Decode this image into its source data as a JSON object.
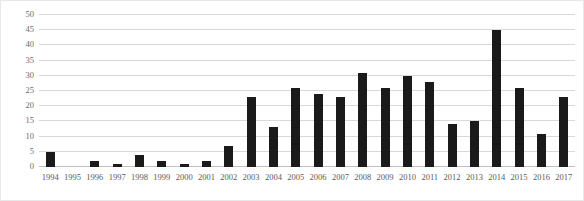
{
  "chart_data": {
    "type": "bar",
    "title": "",
    "xlabel": "",
    "ylabel": "",
    "ylim": [
      0,
      50
    ],
    "yticks": [
      50,
      45,
      40,
      35,
      30,
      25,
      20,
      15,
      10,
      5,
      0
    ],
    "grid": true,
    "legend": false,
    "bar_color": "#1a1a1a",
    "gridline_color": "#d9d9d9",
    "categories": [
      "1994",
      "1995",
      "1996",
      "1997",
      "1998",
      "1999",
      "2000",
      "2001",
      "2002",
      "2003",
      "2004",
      "2005",
      "2006",
      "2007",
      "2008",
      "2009",
      "2010",
      "2011",
      "2012",
      "2013",
      "2014",
      "2015",
      "2016",
      "2017"
    ],
    "values": [
      5,
      0,
      2,
      1,
      4,
      2,
      1,
      2,
      7,
      23,
      13,
      26,
      24,
      23,
      31,
      26,
      30,
      28,
      14,
      15,
      45,
      26,
      11,
      23
    ]
  }
}
